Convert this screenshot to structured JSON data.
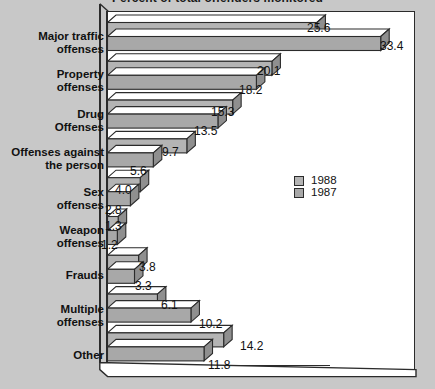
{
  "chart_data": {
    "type": "bar",
    "orientation": "horizontal",
    "style": "3d-grouped-horizontal-bar",
    "title": "Percent of total offenders monitored",
    "xlabel": "",
    "ylabel": "",
    "xlim": [
      0,
      36
    ],
    "grid": false,
    "legend_position": "center-right",
    "categories": [
      "Major traffic\noffenses",
      "Property\noffenses",
      "Drug\nOffenses",
      "Offenses against\nthe person",
      "Sex\noffenses",
      "Weapon\noffenses",
      "Frauds",
      "Multiple\noffenses",
      "Other"
    ],
    "series": [
      {
        "name": "1988",
        "values": [
          25.6,
          20.1,
          15.3,
          9.7,
          4.0,
          1.3,
          3.8,
          6.1,
          14.2
        ],
        "labels": [
          "25.6",
          "20.1",
          "15.3",
          "9.7",
          "4.0",
          "1.3",
          "3.8",
          "6.1",
          "14.2"
        ]
      },
      {
        "name": "1987",
        "values": [
          33.4,
          18.2,
          13.5,
          5.6,
          2.8,
          1.2,
          3.3,
          10.2,
          11.8
        ],
        "labels": [
          "33.4",
          "18.2",
          "13.5",
          "5.6",
          "2.8",
          "1.2",
          "3.3",
          "10.2",
          "11.8"
        ]
      }
    ]
  },
  "legend": {
    "entries": [
      {
        "label": "1988"
      },
      {
        "label": "1987"
      }
    ]
  },
  "colors": {
    "page_background": "#c8c8c8",
    "plot_background": "#ffffff",
    "bar_front_1988": "#b4b4b4",
    "bar_front_1987": "#a8a8a8",
    "bar_top_face": "#ffffff",
    "bar_side_face": "#8f8f8f",
    "outline": "#2b2b2b",
    "text": "#111111"
  }
}
